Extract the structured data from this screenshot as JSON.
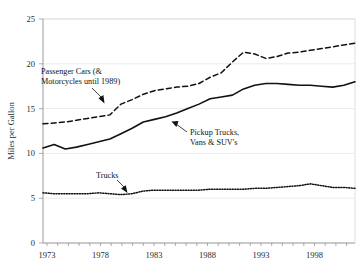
{
  "chart_data": {
    "type": "line",
    "title": "",
    "subtitle": "",
    "xlabel": "",
    "ylabel": "Miles per Gallon",
    "xlim": [
      1973,
      2001
    ],
    "ylim": [
      0,
      25
    ],
    "grid": true,
    "legend_position": "none",
    "xticks": [
      "1973",
      "1978",
      "1983",
      "1988",
      "1993",
      "1998"
    ],
    "xtick_values": [
      1973,
      1978,
      1983,
      1988,
      1993,
      1998
    ],
    "yticks": [
      "0",
      "5",
      "10",
      "15",
      "20",
      "25"
    ],
    "ytick_values": [
      0,
      5,
      10,
      15,
      20,
      25
    ],
    "x": [
      1973,
      1974,
      1975,
      1976,
      1977,
      1978,
      1979,
      1980,
      1981,
      1982,
      1983,
      1984,
      1985,
      1986,
      1987,
      1988,
      1989,
      1990,
      1991,
      1992,
      1993,
      1994,
      1995,
      1996,
      1997,
      1998,
      1999,
      2000,
      2001
    ],
    "series": [
      {
        "name": "Passenger Cars (& Motorcycles until 1989)",
        "style": "dashed",
        "values": [
          13.3,
          13.4,
          13.5,
          13.7,
          13.9,
          14.1,
          14.3,
          15.5,
          16.0,
          16.6,
          17.0,
          17.2,
          17.4,
          17.5,
          17.8,
          18.5,
          19.0,
          20.2,
          21.3,
          21.1,
          20.6,
          20.8,
          21.2,
          21.3,
          21.5,
          21.7,
          21.9,
          22.1,
          22.3
        ]
      },
      {
        "name": "Pickup Trucks, Vans & SUV's",
        "style": "solid",
        "values": [
          10.6,
          11.0,
          10.5,
          10.7,
          11.0,
          11.3,
          11.6,
          12.2,
          12.8,
          13.5,
          13.8,
          14.1,
          14.5,
          15.0,
          15.5,
          16.1,
          16.3,
          16.5,
          17.2,
          17.6,
          17.8,
          17.8,
          17.7,
          17.6,
          17.6,
          17.5,
          17.4,
          17.6,
          18.0
        ]
      },
      {
        "name": "Trucks",
        "style": "dotted",
        "values": [
          5.6,
          5.5,
          5.5,
          5.5,
          5.5,
          5.6,
          5.5,
          5.4,
          5.5,
          5.8,
          5.9,
          5.9,
          5.9,
          5.9,
          5.9,
          6.0,
          6.0,
          6.0,
          6.0,
          6.1,
          6.1,
          6.2,
          6.3,
          6.4,
          6.6,
          6.4,
          6.2,
          6.2,
          6.1
        ]
      }
    ],
    "annotations": [
      {
        "id": "cars",
        "text_line1": "Passenger Cars (&",
        "text_line2": "Motorcycles until 1989)"
      },
      {
        "id": "pickups",
        "text_line1": "Pickup Trucks,",
        "text_line2": "Vans & SUV's"
      },
      {
        "id": "trucks",
        "text_line1": "Trucks",
        "text_line2": ""
      }
    ]
  }
}
